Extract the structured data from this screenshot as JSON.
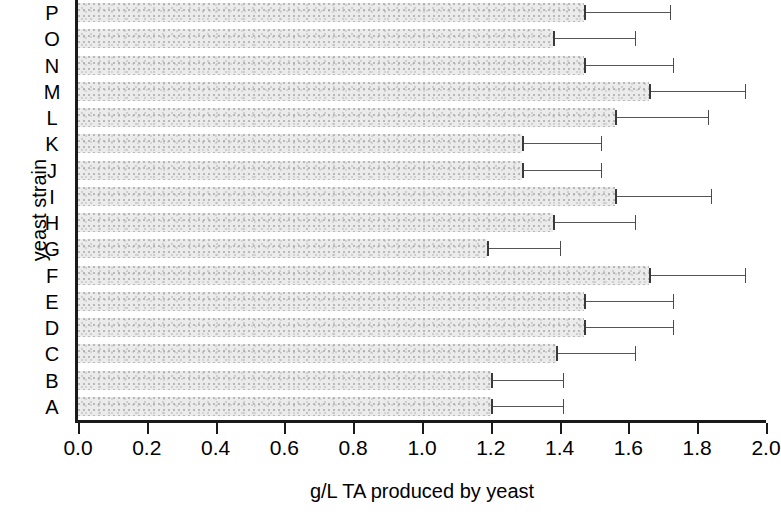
{
  "chart_data": {
    "type": "bar",
    "orientation": "horizontal",
    "title": "",
    "xlabel": "g/L TA produced by yeast",
    "ylabel": "yeast strain",
    "categories": [
      "A",
      "B",
      "C",
      "D",
      "E",
      "F",
      "G",
      "H",
      "I",
      "J",
      "K",
      "L",
      "M",
      "N",
      "O",
      "P"
    ],
    "values": [
      1.2,
      1.2,
      1.39,
      1.47,
      1.47,
      1.66,
      1.19,
      1.38,
      1.56,
      1.29,
      1.29,
      1.56,
      1.66,
      1.47,
      1.38,
      1.47
    ],
    "error_upper": [
      1.41,
      1.41,
      1.62,
      1.73,
      1.73,
      1.94,
      1.4,
      1.62,
      1.84,
      1.52,
      1.52,
      1.83,
      1.94,
      1.73,
      1.62,
      1.72
    ],
    "xlim": [
      0.0,
      2.0
    ],
    "xticks": [
      0.0,
      0.2,
      0.4,
      0.6,
      0.8,
      1.0,
      1.2,
      1.4,
      1.6,
      1.8,
      2.0
    ],
    "xtick_labels": [
      "0.0",
      "0.2",
      "0.4",
      "0.6",
      "0.8",
      "1.0",
      "1.2",
      "1.4",
      "1.6",
      "1.8",
      "2.0"
    ],
    "grid": false,
    "legend": null,
    "bar_color": "#ebebeb",
    "error_color": "#555555",
    "axis_color": "#1a1a1a",
    "category_order_top_to_bottom": [
      "P",
      "O",
      "N",
      "M",
      "L",
      "K",
      "J",
      "I",
      "H",
      "G",
      "F",
      "E",
      "D",
      "C",
      "B",
      "A"
    ]
  }
}
